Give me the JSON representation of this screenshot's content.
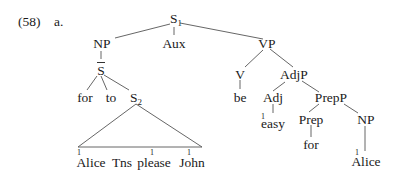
{
  "example": {
    "number": "(58)",
    "sub_label": "a."
  },
  "tree": {
    "root": {
      "label": "S",
      "sub": "1"
    },
    "np": {
      "label": "NP"
    },
    "aux": {
      "label": "Aux"
    },
    "vp": {
      "label": "VP"
    },
    "sbar": {
      "label": "S"
    },
    "for1": {
      "label": "for"
    },
    "to": {
      "label": "to"
    },
    "s2": {
      "label": "S",
      "sub": "2"
    },
    "s2_yield": [
      {
        "word": "Alice",
        "index": "1"
      },
      {
        "word": "Tns",
        "index": ""
      },
      {
        "word": "please",
        "index": "1"
      },
      {
        "word": "John",
        "index": "1"
      }
    ],
    "v": {
      "label": "V"
    },
    "be": {
      "label": "be"
    },
    "adjp": {
      "label": "AdjP"
    },
    "adj": {
      "label": "Adj"
    },
    "easy": {
      "label": "easy",
      "index": "1"
    },
    "prepp": {
      "label": "PrepP"
    },
    "prep": {
      "label": "Prep"
    },
    "for2": {
      "label": "for"
    },
    "np2": {
      "label": "NP"
    },
    "alice2": {
      "label": "Alice",
      "index": "1"
    }
  }
}
